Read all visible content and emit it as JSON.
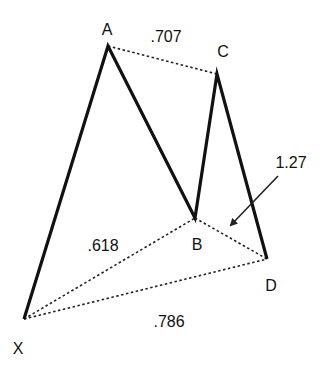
{
  "diagram": {
    "points": {
      "X": {
        "label": "X",
        "x": 24,
        "y": 319,
        "label_x": 18,
        "label_y": 349
      },
      "A": {
        "label": "A",
        "x": 108,
        "y": 46,
        "label_x": 107,
        "label_y": 30
      },
      "B": {
        "label": "B",
        "x": 195,
        "y": 218,
        "label_x": 197,
        "label_y": 245
      },
      "C": {
        "label": "C",
        "x": 217,
        "y": 74,
        "label_x": 223,
        "label_y": 52
      },
      "D": {
        "label": "D",
        "x": 267,
        "y": 259,
        "label_x": 271,
        "label_y": 286
      }
    },
    "ratios": {
      "AC": {
        "text": ".707",
        "x": 166,
        "y": 37
      },
      "XB": {
        "text": ".618",
        "x": 103,
        "y": 246
      },
      "XD": {
        "text": ".786",
        "x": 169,
        "y": 322
      },
      "BD": {
        "text": "1.27",
        "x": 291,
        "y": 163
      }
    },
    "arrow": {
      "from_x": 278,
      "from_y": 176,
      "to_x": 231,
      "to_y": 225
    },
    "colors": {
      "line": "#111111",
      "dotted": "#222222",
      "background": "#ffffff"
    }
  }
}
